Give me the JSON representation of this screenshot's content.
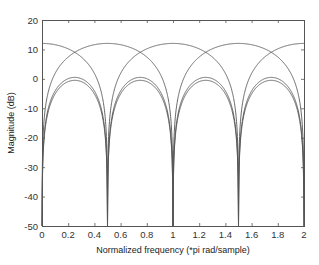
{
  "chart_data": {
    "type": "line",
    "title": "",
    "xlabel": "Normalized frequency (*pi rad/sample)",
    "ylabel": "Magnitude (dB)",
    "xlim": [
      0,
      2
    ],
    "ylim": [
      -50,
      20
    ],
    "xticks": [
      0,
      0.2,
      0.4,
      0.6,
      0.8,
      1,
      1.2,
      1.4,
      1.6,
      1.8,
      2
    ],
    "xtick_labels": [
      "0",
      "0.2",
      "0.4",
      "0.6",
      "0.8",
      "1",
      "1.2",
      "1.4",
      "1.6",
      "1.8",
      "2"
    ],
    "yticks": [
      20,
      10,
      0,
      -10,
      -20,
      -30,
      -40,
      -50
    ],
    "ytick_labels": [
      "20",
      "10",
      "0",
      "-10",
      "-20",
      "-30",
      "-40",
      "-50"
    ],
    "grid": false,
    "legend": null,
    "line_color": "#555555",
    "series": [
      {
        "name": "Response A (peaks at 0, 1, 2)",
        "description": "Peak ~12 dB at 0, 1, 2; nulls at 0.5, 1.5",
        "x": [
          0,
          0.1,
          0.2,
          0.25,
          0.3,
          0.4,
          0.45,
          0.5,
          0.55,
          0.6,
          0.7,
          0.75,
          0.8,
          0.9,
          1.0,
          1.1,
          1.2,
          1.25,
          1.3,
          1.4,
          1.45,
          1.5,
          1.55,
          1.6,
          1.7,
          1.75,
          1.8,
          1.9,
          2.0
        ],
        "y": [
          12,
          11.6,
          10.2,
          9.0,
          7.4,
          1.8,
          -4.0,
          -50,
          -4.0,
          1.8,
          7.4,
          9.0,
          10.2,
          11.6,
          12,
          11.6,
          10.2,
          9.0,
          7.4,
          1.8,
          -4.0,
          -50,
          -4.0,
          1.8,
          7.4,
          9.0,
          10.2,
          11.6,
          12
        ]
      },
      {
        "name": "Response B (peaks at 0.5, 1.5)",
        "description": "Peak ~12 dB at 0.5, 1.5; nulls at 0, 1, 2",
        "x": [
          0,
          0.05,
          0.1,
          0.2,
          0.25,
          0.3,
          0.4,
          0.5,
          0.6,
          0.7,
          0.75,
          0.8,
          0.9,
          0.95,
          1.0,
          1.05,
          1.1,
          1.2,
          1.25,
          1.3,
          1.4,
          1.5,
          1.6,
          1.7,
          1.75,
          1.8,
          1.9,
          1.95,
          2.0
        ],
        "y": [
          -50,
          -4.0,
          1.8,
          7.4,
          9.0,
          10.2,
          11.6,
          12,
          11.6,
          10.2,
          9.0,
          7.4,
          1.8,
          -4.0,
          -50,
          -4.0,
          1.8,
          7.4,
          9.0,
          10.2,
          11.6,
          12,
          11.6,
          10.2,
          9.0,
          7.4,
          1.8,
          -4.0,
          -50
        ]
      },
      {
        "name": "Response C (upper lobe)",
        "description": "Peak ~0.5 dB at 0.25, 0.75, 1.25, 1.75; nulls at 0, 0.5, 1, 1.5, 2",
        "x": [
          0,
          0.05,
          0.1,
          0.15,
          0.25,
          0.35,
          0.4,
          0.45,
          0.5,
          0.55,
          0.6,
          0.65,
          0.75,
          0.85,
          0.9,
          0.95,
          1.0,
          1.05,
          1.1,
          1.15,
          1.25,
          1.35,
          1.4,
          1.45,
          1.5,
          1.55,
          1.6,
          1.65,
          1.75,
          1.85,
          1.9,
          1.95,
          2.0
        ],
        "y": [
          -50,
          -9.7,
          -4.1,
          -1.6,
          0.5,
          -1.6,
          -4.1,
          -9.7,
          -50,
          -9.7,
          -4.1,
          -1.6,
          0.5,
          -1.6,
          -4.1,
          -9.7,
          -50,
          -9.7,
          -4.1,
          -1.6,
          0.5,
          -1.6,
          -4.1,
          -9.7,
          -50,
          -9.7,
          -4.1,
          -1.6,
          0.5,
          -1.6,
          -4.1,
          -9.7,
          -50
        ]
      },
      {
        "name": "Response D (lower lobe)",
        "description": "Peak ~-0.5 dB at 0.25, 0.75, 1.25, 1.75; nulls at 0, 0.5, 1, 1.5, 2",
        "x": [
          0,
          0.05,
          0.1,
          0.15,
          0.25,
          0.35,
          0.4,
          0.45,
          0.5,
          0.55,
          0.6,
          0.65,
          0.75,
          0.85,
          0.9,
          0.95,
          1.0,
          1.05,
          1.1,
          1.15,
          1.25,
          1.35,
          1.4,
          1.45,
          1.5,
          1.55,
          1.6,
          1.65,
          1.75,
          1.85,
          1.9,
          1.95,
          2.0
        ],
        "y": [
          -50,
          -10.7,
          -5.1,
          -2.6,
          -0.5,
          -2.6,
          -5.1,
          -10.7,
          -50,
          -10.7,
          -5.1,
          -2.6,
          -0.5,
          -2.6,
          -5.1,
          -10.7,
          -50,
          -10.7,
          -5.1,
          -2.6,
          -0.5,
          -2.6,
          -5.1,
          -10.7,
          -50,
          -10.7,
          -5.1,
          -2.6,
          -0.5,
          -2.6,
          -5.1,
          -10.7,
          -50
        ]
      }
    ],
    "plot_area_px": {
      "left": 42,
      "right": 304,
      "top": 20,
      "bottom": 226
    }
  }
}
